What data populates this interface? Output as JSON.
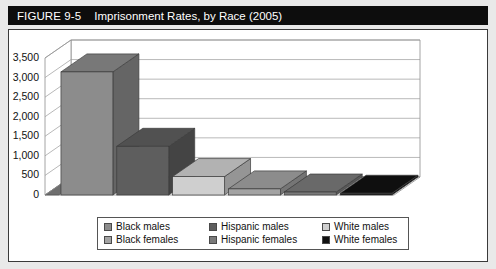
{
  "figure": {
    "number": "FIGURE 9-5",
    "title": "Imprisonment Rates, by Race (2005)"
  },
  "chart_data": {
    "type": "bar",
    "title": "Imprisonment Rates, by Race (2005)",
    "xlabel": "",
    "ylabel": "",
    "ylim": [
      0,
      3500
    ],
    "yticks": [
      "0",
      "500",
      "1,000",
      "1,500",
      "2,000",
      "2,500",
      "3,000",
      "3,500"
    ],
    "ytick_values": [
      0,
      500,
      1000,
      1500,
      2000,
      2500,
      3000,
      3500
    ],
    "grid": true,
    "legend_position": "bottom",
    "perspective": "3d",
    "categories": [
      "Black males",
      "Hispanic males",
      "White males",
      "Black females",
      "Hispanic females",
      "White females"
    ],
    "values": [
      3145,
      1244,
      471,
      156,
      76,
      45
    ],
    "colors": [
      "#8c8c8c",
      "#5e5e5e",
      "#cfcfcf",
      "#a3a3a3",
      "#7a7a7a",
      "#111111"
    ]
  },
  "legend": {
    "items": [
      {
        "label": "Black males",
        "color": "#8c8c8c"
      },
      {
        "label": "Hispanic males",
        "color": "#5e5e5e"
      },
      {
        "label": "White males",
        "color": "#cfcfcf"
      },
      {
        "label": "Black females",
        "color": "#a3a3a3"
      },
      {
        "label": "Hispanic females",
        "color": "#7a7a7a"
      },
      {
        "label": "White females",
        "color": "#111111"
      }
    ]
  }
}
